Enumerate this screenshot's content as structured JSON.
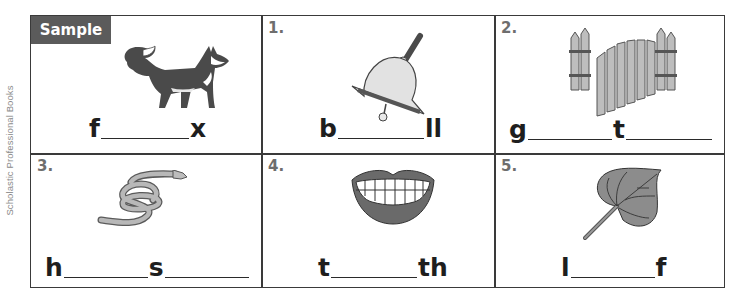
{
  "credit": "Scholastic Professional Books",
  "sample_label": "Sample",
  "colors": {
    "border": "#3a3a3a",
    "badge_bg": "#5b5b5b",
    "number_text": "#6e6e6e",
    "picture_gray": "#8c8c8c",
    "picture_dark": "#4a4a4a"
  },
  "cells": [
    {
      "number": "Sample",
      "picture": "fox",
      "parts": [
        "f",
        "_",
        "x"
      ]
    },
    {
      "number": "1.",
      "picture": "bell",
      "parts": [
        "b",
        "_",
        "ll"
      ]
    },
    {
      "number": "2.",
      "picture": "gate",
      "parts": [
        "g",
        "_",
        "t",
        "_"
      ]
    },
    {
      "number": "3.",
      "picture": "hose",
      "parts": [
        "h",
        "_",
        "s",
        "_"
      ]
    },
    {
      "number": "4.",
      "picture": "teeth",
      "parts": [
        "t",
        "_",
        "th"
      ]
    },
    {
      "number": "5.",
      "picture": "leaf",
      "parts": [
        "l",
        "_",
        "f"
      ]
    }
  ]
}
